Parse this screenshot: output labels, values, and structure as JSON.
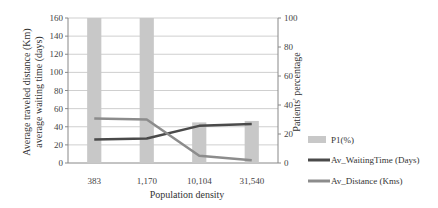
{
  "chart_data": {
    "type": "bar+line",
    "title": "",
    "categories": [
      "383",
      "1,170",
      "10,104",
      "31,540"
    ],
    "xlabel": "Population density",
    "ylabel_left": [
      "Average traveled distance (Km)",
      "average waiting time (days)"
    ],
    "ylabel_right": "Patients' percentage",
    "ylim_left": [
      0,
      160
    ],
    "ylim_right": [
      0,
      100
    ],
    "yticks_left": [
      "0",
      "20",
      "40",
      "60",
      "80",
      "100",
      "120",
      "140",
      "160"
    ],
    "yticks_right": [
      "0",
      "20",
      "40",
      "60",
      "80",
      "100"
    ],
    "grid": true,
    "legend_position": "right",
    "series": [
      {
        "name": "P1(%)",
        "type": "bar",
        "axis": "right",
        "color": "#c8c8c8",
        "values": [
          100,
          100,
          28,
          29
        ]
      },
      {
        "name": "Av_WaitingTime (Days)",
        "type": "line",
        "axis": "left",
        "color": "#4a4a4a",
        "values": [
          26,
          27,
          41,
          43
        ]
      },
      {
        "name": "Av_Distance (Kms)",
        "type": "line",
        "axis": "left",
        "color": "#8c8c8c",
        "values": [
          49,
          48,
          8,
          3
        ]
      }
    ]
  }
}
